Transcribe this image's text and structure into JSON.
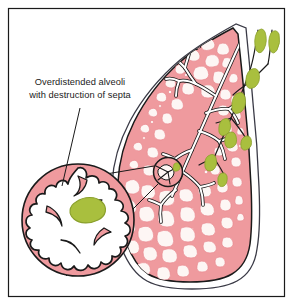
{
  "figure": {
    "title": "Overdistended alveoli with destruction of septa",
    "background_color": "#ffffff",
    "frame": {
      "stroke_color": "#1a1a1a",
      "stroke_width": 1.2,
      "inset": 8
    }
  },
  "annotation": {
    "line_1": "Overdistended alveoli",
    "line_2": "with destruction of septa",
    "text_color": "#1b1b1b",
    "font_size_px": 9.3,
    "leader_line_color": "#1a1a1a"
  },
  "colors": {
    "parenchyma_pink": "#ef9a9e",
    "parenchyma_pink_deep": "#e98a90",
    "alveoli_white": "#fdf6f4",
    "vessel_green": "#a9bf3e",
    "vessel_green_dark": "#8aa02c",
    "outline_black": "#1a1a1a",
    "pleura_white": "#ffffff",
    "bronchus_white": "#ffffff",
    "circle_rim_pink": "#ecaab0"
  },
  "labels": {
    "lung_outline": "lung-cross-section",
    "pleura": "pleural-surface",
    "bronchial_tree": "bronchial-tree",
    "pulmonary_vessels": "pulmonary-vessels",
    "magnifier_source": "magnification-source-circle",
    "magnifier_detail": "magnified-alveoli-circle",
    "detail_vessel": "alveolar-capillary-vessel",
    "detail_airspace": "enlarged-airspace"
  },
  "geometry": {
    "source_circle": {
      "cx": 168,
      "cy": 172,
      "r": 15
    },
    "detail_circle": {
      "cx": 78,
      "cy": 220,
      "r": 57
    }
  }
}
